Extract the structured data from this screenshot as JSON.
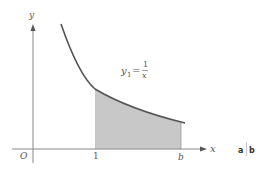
{
  "diagram": {
    "axes": {
      "x_label": "x",
      "y_label": "y",
      "origin_label": "O"
    },
    "ticks": {
      "one": "1",
      "b": "b"
    },
    "curve": {
      "label_main": "y",
      "label_sub": "1",
      "label_eq": "=",
      "numerator": "1",
      "denominator": "x",
      "function": "1/x"
    },
    "shaded_region": {
      "from": "1",
      "to": "b",
      "color": "#c8c8c8"
    },
    "panel_labels": {
      "a": "a",
      "b": "b"
    },
    "colors": {
      "curve": "#555555",
      "axes": "#888888"
    }
  }
}
